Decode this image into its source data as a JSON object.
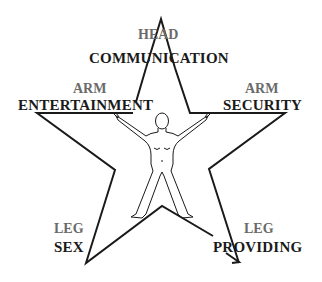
{
  "diagram": {
    "type": "five-point-star",
    "colors": {
      "outline": "#1a1a1a",
      "part_label": "#6a6a6a",
      "role_label": "#1a1a1a",
      "background": "#ffffff"
    },
    "points": [
      {
        "id": "head",
        "part": "HEAD",
        "role": "COMMUNICATION"
      },
      {
        "id": "left-arm",
        "part": "ARM",
        "role": "ENTERTAINMENT"
      },
      {
        "id": "right-arm",
        "part": "ARM",
        "role": "SECURITY"
      },
      {
        "id": "left-leg",
        "part": "LEG",
        "role": "SEX"
      },
      {
        "id": "right-leg",
        "part": "LEG",
        "role": "PROVIDING"
      }
    ],
    "center_figure": "human-figure-arms-and-legs-outstretched"
  }
}
